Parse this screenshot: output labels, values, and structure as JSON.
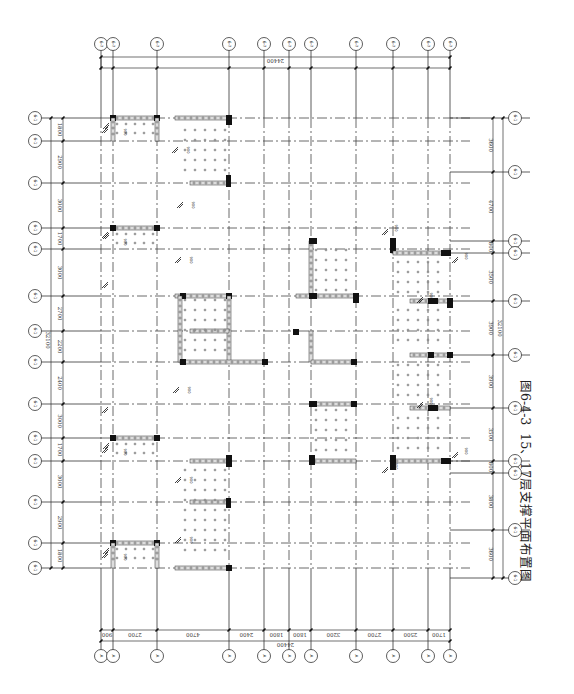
{
  "caption": {
    "figure_number": "图6-4-3",
    "title": "15、17层支撑平面布置图"
  },
  "plan": {
    "orientation": "rotated 90 degrees clockwise",
    "vertical_grid_x": [
      101,
      113,
      157,
      229,
      264,
      289,
      311,
      356,
      393,
      428,
      450
    ],
    "horizontal_grid_y": [
      118,
      141,
      183,
      228,
      249,
      296,
      331,
      362,
      404,
      438,
      461,
      502,
      543,
      568
    ],
    "top_axis_bubbles_count": 11,
    "bottom_axis_bubble_label": "A",
    "left_axis_bubble_label": "6-1",
    "right_axis_bubble_label": "6-1"
  },
  "dimensions": {
    "top_total": "24400",
    "bottom_total": "24400",
    "bottom_segments": [
      "900",
      "2700",
      "4700",
      "2400",
      "1800",
      "1800",
      "3200",
      "2700",
      "2500",
      "1700"
    ],
    "left_total": "32100",
    "left_segments": [
      "1800",
      "2900",
      "3000",
      "1700",
      "3000",
      "2700",
      "2200",
      "2400",
      "3000",
      "1700",
      "3000",
      "2900",
      "1800"
    ],
    "right_total": "32100",
    "right_segments": [
      "3600",
      "4700",
      "800",
      "3500",
      "3900",
      "3900",
      "3500",
      "800",
      "3800",
      "3600"
    ]
  },
  "annotations": {
    "brace_spacing_label": "900",
    "brace_width_label": "1200"
  }
}
